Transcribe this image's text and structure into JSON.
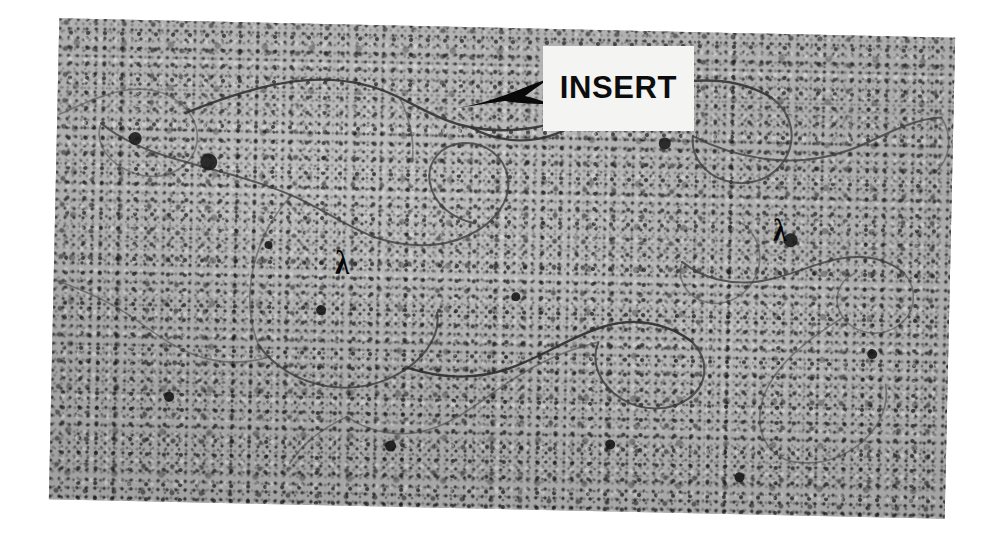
{
  "figure": {
    "kind": "electron-micrograph",
    "background_color": "#ffffff",
    "plate_color": "#b4b4b4",
    "plate_rotation_deg": 1.25
  },
  "annotations": {
    "insert_label": {
      "text": "INSERT",
      "box_color": "#f4f4f2",
      "text_color": "#0d0d0d"
    },
    "insert_arrow": {
      "name": "arrow-pointing-left",
      "color": "#0a0a0a",
      "direction": "left"
    },
    "lambda_left": {
      "text": "λ",
      "color": "#070707"
    },
    "lambda_right": {
      "text": "λ",
      "color": "#070707"
    }
  },
  "dna_paths": {
    "upper_left_loop": "M 2 96 C 24 86, 46 74, 70 70 C 96 66, 118 74, 132 92 C 146 110, 142 134, 126 146 C 108 160, 84 158, 66 148 C 48 138, 38 120, 44 104",
    "upper_long_arm": "M 128 92 C 160 78, 196 64, 236 58 C 276 52, 312 58, 342 72 C 368 84, 388 96, 414 100 C 448 106, 486 100, 520 86 C 556 71, 588 56, 626 50 C 660 45, 690 50, 714 64",
    "upper_right_fold": "M 714 64 C 736 80, 740 106, 728 126 C 716 146, 692 154, 670 148 C 648 142, 634 124, 636 104",
    "mid_left_branch": "M 44 104 C 64 120, 94 132, 126 140 C 164 150, 202 158, 236 172 C 268 185, 292 202, 320 212",
    "mid_center_loop": "M 320 212 C 352 222, 386 222, 414 208 C 440 195, 456 172, 452 150 C 448 128, 428 114, 406 116 C 384 118, 370 136, 374 156 C 378 178, 398 192, 420 196",
    "mid_descend": "M 236 172 C 218 192, 206 216, 200 242 C 194 270, 196 298, 206 322",
    "lower_left_loop": "M 206 322 C 222 344, 248 358, 276 362 C 306 366, 334 358, 356 342 C 376 327, 388 306, 384 286",
    "lower_center_big": "M 356 342 C 390 352, 426 352, 458 340 C 492 327, 520 306, 552 296 C 584 286, 616 292, 640 310",
    "lower_return": "M 640 310 C 658 328, 656 352, 638 366 C 618 381, 590 380, 570 368 C 548 355, 538 332, 546 312",
    "lower_tail": "M 546 312 C 516 320, 486 334, 460 352 C 432 371, 410 392, 382 402 C 352 413, 320 408, 296 392",
    "right_upper_strand": "M 636 104 C 660 116, 688 124, 718 126 C 752 128, 784 120, 812 106 C 836 94, 858 82, 884 80",
    "right_mid_wiggle": "M 684 188 C 704 200, 710 222, 702 242 C 694 262, 674 274, 654 270 C 634 266, 622 248, 628 230",
    "right_lower_zigzag": "M 628 230 C 648 246, 676 252, 704 248 C 732 244, 756 230, 782 224 C 808 218, 832 222, 850 236",
    "right_edge_loop": "M 850 236 C 866 254, 862 278, 844 290 C 826 302, 802 298, 790 282 C 778 266, 784 246, 800 238",
    "right_bottom_curl": "M 790 282 C 768 296, 746 312, 730 332 C 714 352, 706 374, 710 394 C 714 414, 730 428, 750 428",
    "far_right_strand": "M 884 80 C 896 98, 894 120, 880 134",
    "lower_right_arc": "M 750 428 C 774 430, 798 420, 814 404 C 830 388, 838 368, 834 348",
    "left_lower_faint": "M 2 262 C 26 270, 52 280, 74 294 C 98 309, 118 326, 144 334",
    "left_bottom_faint": "M 144 334 C 168 342, 194 342, 216 334",
    "bottom_center_faint": "M 296 392 C 272 404, 252 420, 240 440",
    "upper_mid_faint": "M 342 72 C 352 92, 358 114, 356 136",
    "insert_region_strand": "M 414 100 C 428 108, 444 112, 462 112 C 482 112, 500 106, 516 96"
  },
  "stain_blobs": [
    {
      "x": 78,
      "y": 118,
      "r": 6.5
    },
    {
      "x": 152,
      "y": 140,
      "r": 8.5
    },
    {
      "x": 608,
      "y": 112,
      "r": 6.0
    },
    {
      "x": 736,
      "y": 206,
      "r": 7.0
    },
    {
      "x": 268,
      "y": 286,
      "r": 5.0
    },
    {
      "x": 462,
      "y": 268,
      "r": 4.5
    },
    {
      "x": 820,
      "y": 318,
      "r": 5.0
    },
    {
      "x": 340,
      "y": 420,
      "r": 5.5
    },
    {
      "x": 560,
      "y": 414,
      "r": 4.8
    },
    {
      "x": 118,
      "y": 376,
      "r": 5.2
    },
    {
      "x": 690,
      "y": 444,
      "r": 5.0
    },
    {
      "x": 214,
      "y": 222,
      "r": 4.2
    }
  ]
}
